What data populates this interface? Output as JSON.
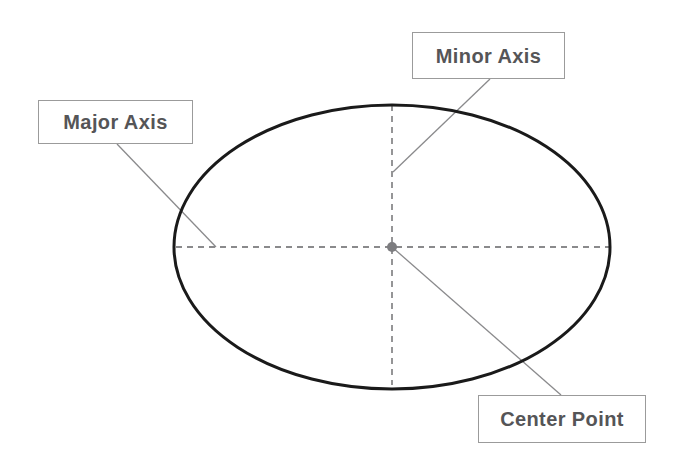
{
  "diagram": {
    "background_color": "#ffffff"
  },
  "shape": {
    "name": "ellipse-outline",
    "center_x": 392,
    "center_y": 247,
    "radius_x": 218,
    "radius_y": 142,
    "stroke_color": "#1a1a1a",
    "stroke_width": 3,
    "fill": "none"
  },
  "axes": {
    "major": {
      "name": "major-axis-dashed-line",
      "x1": 176,
      "y1": 247,
      "x2": 610,
      "y2": 247,
      "stroke_color": "#8a8a8c",
      "dash": "6 5"
    },
    "minor": {
      "name": "minor-axis-dashed-line",
      "x1": 392,
      "y1": 105,
      "x2": 392,
      "y2": 385,
      "stroke_color": "#8a8a8c",
      "dash": "6 5"
    }
  },
  "center_point": {
    "name": "center-point-dot",
    "x": 392,
    "y": 247,
    "radius": 5,
    "fill_color": "#7d7d80"
  },
  "callouts": [
    {
      "id": "major-axis",
      "label": "Major Axis",
      "box": {
        "x": 38,
        "y": 100,
        "width": 155,
        "height": 44
      },
      "leader": {
        "x1": 117,
        "y1": 144,
        "x2": 216,
        "y2": 247
      },
      "border_color": "#9b9b9b",
      "text_color": "#555557"
    },
    {
      "id": "minor-axis",
      "label": "Minor Axis",
      "box": {
        "x": 412,
        "y": 32,
        "width": 153,
        "height": 47
      },
      "leader": {
        "x1": 490,
        "y1": 79,
        "x2": 393,
        "y2": 172
      },
      "border_color": "#9b9b9b",
      "text_color": "#555557"
    },
    {
      "id": "center-point",
      "label": "Center Point",
      "box": {
        "x": 478,
        "y": 395,
        "width": 168,
        "height": 48
      },
      "leader": {
        "x1": 392,
        "y1": 247,
        "x2": 561,
        "y2": 395
      },
      "border_color": "#9b9b9b",
      "text_color": "#555557"
    }
  ],
  "colors": {
    "ellipse_stroke": "#1a1a1a",
    "dashed_axis": "#8a8a8c",
    "leader_line": "#8a8a8c",
    "box_border": "#9b9b9b",
    "text": "#555557",
    "center_dot": "#7d7d80"
  }
}
